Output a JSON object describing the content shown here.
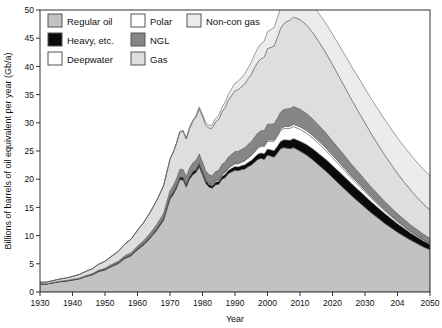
{
  "chart_data": {
    "type": "area",
    "stacked": true,
    "title": "",
    "xlabel": "Year",
    "ylabel": "Billions of barrels of oil equivalent per year (Gb/a)",
    "xlim": [
      1930,
      2050
    ],
    "ylim": [
      0,
      50
    ],
    "xticks": [
      1930,
      1940,
      1950,
      1960,
      1970,
      1980,
      1990,
      2000,
      2010,
      2020,
      2030,
      2040,
      2050
    ],
    "xticklabels": [
      "1930",
      "1940",
      "1950",
      "1960",
      "1970",
      "1980",
      "1990",
      "2000",
      "2010",
      "2020",
      "2030",
      "204",
      "2050"
    ],
    "yticks": [
      0,
      5,
      10,
      15,
      20,
      25,
      30,
      35,
      40,
      45,
      50
    ],
    "yticklabels": [
      "0",
      "5",
      "10",
      "15",
      "20",
      "25",
      "30",
      "35",
      "40",
      "45",
      "50"
    ],
    "grid": false,
    "legend_position": "top-left-inside",
    "x": [
      1930,
      1932,
      1934,
      1936,
      1938,
      1940,
      1942,
      1944,
      1946,
      1948,
      1950,
      1952,
      1954,
      1956,
      1958,
      1960,
      1962,
      1964,
      1966,
      1968,
      1970,
      1971,
      1972,
      1973,
      1974,
      1975,
      1976,
      1977,
      1978,
      1979,
      1980,
      1981,
      1982,
      1983,
      1984,
      1985,
      1986,
      1987,
      1988,
      1989,
      1990,
      1991,
      1992,
      1993,
      1994,
      1995,
      1996,
      1997,
      1998,
      1999,
      2000,
      2001,
      2002,
      2003,
      2004,
      2005,
      2006,
      2007,
      2008,
      2010,
      2012,
      2014,
      2016,
      2018,
      2020,
      2022,
      2024,
      2026,
      2028,
      2030,
      2032,
      2034,
      2036,
      2038,
      2040,
      2042,
      2044,
      2046,
      2048,
      2050
    ],
    "series": [
      {
        "name": "Regular oil",
        "color": "#c2c2c2",
        "values": [
          1.4,
          1.4,
          1.6,
          1.8,
          1.9,
          2.1,
          2.3,
          2.7,
          3.0,
          3.6,
          3.9,
          4.5,
          5.0,
          5.9,
          6.4,
          7.5,
          8.4,
          9.6,
          11.0,
          12.7,
          16.5,
          17.3,
          18.4,
          19.9,
          19.9,
          18.6,
          20.0,
          20.8,
          21.2,
          22.2,
          20.8,
          19.3,
          18.6,
          18.4,
          19.0,
          19.1,
          20.0,
          20.3,
          21.0,
          21.3,
          21.6,
          21.5,
          21.7,
          21.8,
          22.2,
          22.5,
          23.0,
          23.5,
          23.7,
          23.5,
          24.3,
          24.1,
          23.9,
          24.6,
          25.4,
          25.6,
          25.5,
          25.4,
          25.6,
          25.0,
          24.3,
          23.4,
          22.4,
          21.4,
          20.3,
          19.2,
          18.1,
          17.0,
          16.0,
          15.0,
          14.0,
          13.1,
          12.2,
          11.4,
          10.6,
          9.9,
          9.2,
          8.6,
          8.0,
          7.5
        ]
      },
      {
        "name": "Heavy, etc.",
        "color": "#0a0a0a",
        "values": [
          0.05,
          0.05,
          0.06,
          0.06,
          0.07,
          0.08,
          0.08,
          0.09,
          0.1,
          0.11,
          0.12,
          0.14,
          0.15,
          0.17,
          0.18,
          0.2,
          0.22,
          0.25,
          0.28,
          0.31,
          0.35,
          0.37,
          0.4,
          0.42,
          0.43,
          0.42,
          0.45,
          0.47,
          0.48,
          0.5,
          0.48,
          0.46,
          0.45,
          0.46,
          0.48,
          0.5,
          0.53,
          0.56,
          0.6,
          0.63,
          0.66,
          0.68,
          0.71,
          0.74,
          0.78,
          0.82,
          0.87,
          0.92,
          0.96,
          1.0,
          1.06,
          1.1,
          1.15,
          1.22,
          1.3,
          1.38,
          1.45,
          1.52,
          1.6,
          1.74,
          1.86,
          1.96,
          2.04,
          2.1,
          2.14,
          2.16,
          2.16,
          2.14,
          2.1,
          2.04,
          1.96,
          1.86,
          1.76,
          1.64,
          1.52,
          1.4,
          1.28,
          1.16,
          1.05,
          0.95
        ]
      },
      {
        "name": "Deepwater",
        "color": "#ffffff",
        "values": [
          0,
          0,
          0,
          0,
          0,
          0,
          0,
          0,
          0,
          0,
          0,
          0,
          0,
          0,
          0,
          0,
          0,
          0,
          0,
          0,
          0.02,
          0.03,
          0.04,
          0.05,
          0.06,
          0.07,
          0.08,
          0.1,
          0.12,
          0.14,
          0.15,
          0.16,
          0.18,
          0.2,
          0.23,
          0.26,
          0.3,
          0.34,
          0.38,
          0.43,
          0.48,
          0.54,
          0.6,
          0.67,
          0.75,
          0.84,
          0.94,
          1.05,
          1.16,
          1.28,
          1.4,
          1.52,
          1.64,
          1.76,
          1.88,
          1.98,
          2.06,
          2.12,
          2.15,
          2.12,
          2.02,
          1.88,
          1.72,
          1.55,
          1.38,
          1.22,
          1.08,
          0.95,
          0.83,
          0.72,
          0.62,
          0.54,
          0.46,
          0.39,
          0.33,
          0.28,
          0.24,
          0.2,
          0.17,
          0.14
        ]
      },
      {
        "name": "Polar",
        "color": "#ffffff",
        "values": [
          0,
          0,
          0,
          0,
          0,
          0,
          0,
          0,
          0,
          0,
          0,
          0,
          0,
          0,
          0,
          0,
          0,
          0,
          0,
          0,
          0,
          0,
          0,
          0,
          0,
          0,
          0,
          0.01,
          0.01,
          0.02,
          0.02,
          0.03,
          0.04,
          0.05,
          0.06,
          0.07,
          0.08,
          0.09,
          0.1,
          0.11,
          0.12,
          0.13,
          0.14,
          0.15,
          0.16,
          0.17,
          0.18,
          0.19,
          0.2,
          0.22,
          0.24,
          0.26,
          0.28,
          0.3,
          0.32,
          0.34,
          0.36,
          0.38,
          0.4,
          0.44,
          0.46,
          0.47,
          0.47,
          0.46,
          0.44,
          0.42,
          0.39,
          0.36,
          0.33,
          0.3,
          0.27,
          0.24,
          0.21,
          0.18,
          0.16,
          0.14,
          0.12,
          0.1,
          0.09,
          0.08
        ]
      },
      {
        "name": "NGL",
        "color": "#868686",
        "values": [
          0.03,
          0.03,
          0.04,
          0.05,
          0.06,
          0.07,
          0.08,
          0.1,
          0.12,
          0.15,
          0.18,
          0.22,
          0.26,
          0.32,
          0.38,
          0.46,
          0.54,
          0.64,
          0.76,
          0.9,
          1.1,
          1.18,
          1.26,
          1.36,
          1.38,
          1.34,
          1.42,
          1.5,
          1.56,
          1.62,
          1.58,
          1.52,
          1.5,
          1.52,
          1.58,
          1.64,
          1.72,
          1.8,
          1.88,
          1.96,
          2.04,
          2.08,
          2.14,
          2.2,
          2.28,
          2.36,
          2.44,
          2.52,
          2.58,
          2.64,
          2.74,
          2.78,
          2.82,
          2.9,
          3.0,
          3.06,
          3.1,
          3.12,
          3.14,
          3.1,
          3.02,
          2.92,
          2.8,
          2.66,
          2.52,
          2.38,
          2.24,
          2.1,
          1.96,
          1.83,
          1.7,
          1.58,
          1.47,
          1.36,
          1.26,
          1.17,
          1.08,
          1.0,
          0.93,
          0.86
        ]
      },
      {
        "name": "Gas",
        "color": "#dedede",
        "values": [
          0.25,
          0.28,
          0.32,
          0.38,
          0.44,
          0.52,
          0.62,
          0.74,
          0.88,
          1.05,
          1.25,
          1.48,
          1.75,
          2.05,
          2.4,
          2.8,
          3.25,
          3.75,
          4.3,
          4.9,
          5.55,
          5.9,
          6.25,
          6.6,
          6.75,
          6.7,
          7.05,
          7.35,
          7.65,
          8.0,
          8.1,
          8.15,
          8.25,
          8.45,
          8.8,
          9.05,
          9.3,
          9.7,
          10.1,
          10.45,
          10.8,
          10.95,
          11.1,
          11.35,
          11.6,
          11.9,
          12.35,
          12.55,
          12.75,
          13.0,
          13.45,
          13.6,
          13.85,
          14.3,
          14.8,
          15.2,
          15.5,
          15.7,
          15.85,
          15.9,
          15.7,
          15.3,
          14.8,
          14.2,
          13.55,
          12.85,
          12.15,
          11.45,
          10.75,
          10.1,
          9.45,
          8.85,
          8.25,
          7.7,
          7.15,
          6.65,
          6.2,
          5.75,
          5.35,
          5.0
        ]
      },
      {
        "name": "Non-con gas",
        "color": "#ececec",
        "values": [
          0,
          0,
          0,
          0,
          0,
          0,
          0,
          0,
          0,
          0,
          0,
          0,
          0,
          0,
          0,
          0,
          0,
          0,
          0,
          0,
          0.05,
          0.07,
          0.09,
          0.12,
          0.14,
          0.16,
          0.2,
          0.24,
          0.28,
          0.34,
          0.38,
          0.42,
          0.48,
          0.55,
          0.63,
          0.72,
          0.82,
          0.94,
          1.06,
          1.2,
          1.35,
          1.48,
          1.62,
          1.78,
          1.95,
          2.12,
          2.3,
          2.48,
          2.65,
          2.82,
          3.0,
          3.14,
          3.28,
          3.45,
          3.62,
          3.78,
          3.92,
          4.05,
          4.18,
          4.4,
          4.6,
          4.8,
          5.0,
          5.2,
          5.4,
          5.58,
          5.74,
          5.88,
          6.0,
          6.1,
          6.18,
          6.24,
          6.28,
          6.3,
          6.3,
          6.28,
          6.24,
          6.18,
          6.12,
          6.05
        ]
      }
    ]
  },
  "legend": {
    "items": [
      {
        "label": "Regular oil",
        "color": "#c2c2c2",
        "col": 0,
        "row": 0
      },
      {
        "label": "Heavy, etc.",
        "color": "#0a0a0a",
        "col": 0,
        "row": 1
      },
      {
        "label": "Deepwater",
        "color": "#ffffff",
        "col": 0,
        "row": 2
      },
      {
        "label": "Polar",
        "color": "#ffffff",
        "col": 1,
        "row": 0
      },
      {
        "label": "NGL",
        "color": "#868686",
        "col": 1,
        "row": 1
      },
      {
        "label": "Gas",
        "color": "#dedede",
        "col": 1,
        "row": 2
      },
      {
        "label": "Non-con gas",
        "color": "#ececec",
        "col": 2,
        "row": 0
      }
    ]
  },
  "axes": {
    "x_title": "Year",
    "y_title": "Billions of barrels of oil equivalent per year (Gb/a)"
  }
}
